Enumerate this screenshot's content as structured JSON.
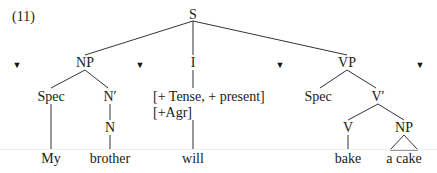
{
  "example_number": "(11)",
  "markers": {
    "glyph": "▼",
    "count": 4
  },
  "nodes": {
    "S": "S",
    "NP": "NP",
    "I": "I",
    "VP": "VP",
    "NP_spec": "Spec",
    "N_bar": "N′",
    "N": "N",
    "I_features_line1": "[+ Tense, + present]",
    "I_features_line2": "[+Agr]",
    "VP_spec": "Spec",
    "V_bar": "V′",
    "V": "V",
    "obj_NP": "NP"
  },
  "leaves": {
    "my": "My",
    "brother": "brother",
    "will": "will",
    "bake": "bake",
    "a_cake": "a cake"
  },
  "tree_structure": {
    "label": "S",
    "children": [
      {
        "label": "NP",
        "children": [
          {
            "label": "Spec",
            "children": [
              {
                "label": "My"
              }
            ]
          },
          {
            "label": "N′",
            "children": [
              {
                "label": "N",
                "children": [
                  {
                    "label": "brother"
                  }
                ]
              }
            ]
          }
        ]
      },
      {
        "label": "I",
        "features": [
          "+Tense",
          "+present",
          "+Agr"
        ],
        "children": [
          {
            "label": "will"
          }
        ]
      },
      {
        "label": "VP",
        "children": [
          {
            "label": "Spec"
          },
          {
            "label": "V′",
            "children": [
              {
                "label": "V",
                "children": [
                  {
                    "label": "bake"
                  }
                ]
              },
              {
                "label": "NP",
                "triangle": true,
                "children": [
                  {
                    "label": "a cake"
                  }
                ]
              }
            ]
          }
        ]
      }
    ]
  }
}
